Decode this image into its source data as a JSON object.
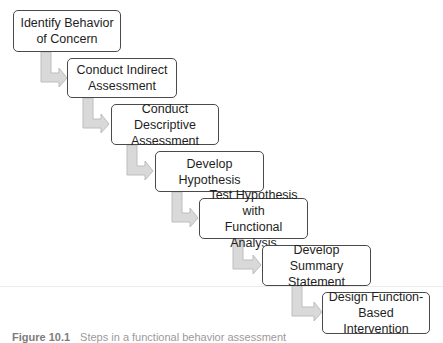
{
  "diagram": {
    "type": "staircase-flowchart",
    "steps": [
      {
        "label": "Identify Behavior of Concern",
        "lines": [
          "Identify Behavior",
          "of Concern"
        ]
      },
      {
        "label": "Conduct Indirect Assessment",
        "lines": [
          "Conduct Indirect",
          "Assessment"
        ]
      },
      {
        "label": "Conduct Descriptive Assessment",
        "lines": [
          "Conduct Descriptive",
          "Assessment"
        ]
      },
      {
        "label": "Develop Hypothesis",
        "lines": [
          "Develop",
          "Hypothesis"
        ]
      },
      {
        "label": "Test Hypothesis with Functional Analysis",
        "lines": [
          "Test Hypothesis with",
          "Functional Analysis"
        ]
      },
      {
        "label": "Develop Summary Statement",
        "lines": [
          "Develop Summary",
          "Statement"
        ]
      },
      {
        "label": "Design Function-Based Intervention",
        "lines": [
          "Design Function-",
          "Based Intervention"
        ]
      }
    ],
    "colors": {
      "box_border": "#4a4a4a",
      "arrow_fill": "#d9d9d9",
      "arrow_stroke": "#bdbdbd",
      "text": "#1e1e1e"
    }
  },
  "caption": {
    "figure_number": "Figure 10.1",
    "text": "Steps in a functional behavior assessment"
  }
}
